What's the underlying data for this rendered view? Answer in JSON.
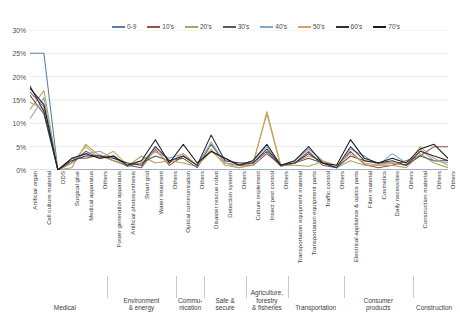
{
  "chart_data": {
    "type": "line",
    "title": "",
    "xlabel": "",
    "ylabel": "",
    "ylim": [
      0,
      30
    ],
    "ytick_labels": [
      "0%",
      "5%",
      "10%",
      "15%",
      "20%",
      "25%",
      "30%"
    ],
    "ytick_values": [
      0,
      5,
      10,
      15,
      20,
      25,
      30
    ],
    "grid": true,
    "legend_position": "top",
    "categories": [
      "Artificial organ",
      "Cell culture material",
      "DDS",
      "Surgical glue",
      "Medical apparatus",
      "Others",
      "Power generation apparatus",
      "Artificial photosynthesis",
      "Smart grid",
      "Water treatment",
      "Others",
      "Optical communication",
      "Others",
      "Disaster rescue robot",
      "Detection system",
      "Others",
      "Culture implement",
      "Insect pest control",
      "Others",
      "Transportation equipment material",
      "Transportation equipment parts",
      "Traffic control",
      "Others",
      "Electrical appliance & optics parts",
      "Fiber material",
      "Cosmetics",
      "Daily necessities",
      "Others",
      "Construction material",
      "Others",
      "Others"
    ],
    "groups": [
      {
        "label": "Medical",
        "start": 0,
        "end": 5
      },
      {
        "label": "Environment\n& energy",
        "start": 6,
        "end": 10
      },
      {
        "label": "Commu-\nnication",
        "start": 11,
        "end": 12
      },
      {
        "label": "Safe &\nsecure",
        "start": 13,
        "end": 15
      },
      {
        "label": "Agriculture,\nforestry\n& fisheries",
        "start": 16,
        "end": 18
      },
      {
        "label": "Transportation",
        "start": 19,
        "end": 22
      },
      {
        "label": "Consumer\nproducts",
        "start": 23,
        "end": 27
      },
      {
        "label": "Construction",
        "start": 28,
        "end": 30
      }
    ],
    "series": [
      {
        "name": "0-9",
        "color": "#5b7fa6",
        "values": [
          25,
          25,
          0,
          0,
          0,
          0,
          0,
          0,
          0,
          0,
          0,
          0,
          0,
          0,
          0,
          0,
          0,
          0,
          0,
          0,
          0,
          0,
          0,
          0,
          0,
          0,
          0,
          0,
          0,
          0,
          0
        ]
      },
      {
        "name": "10's",
        "color": "#9e4b4b",
        "values": [
          16.7,
          13.5,
          0,
          2.5,
          2.5,
          3.2,
          2.0,
          1.0,
          0.5,
          4.5,
          1.0,
          3.0,
          1.0,
          4.0,
          2.5,
          1.0,
          1.0,
          3.5,
          1.0,
          1.5,
          4.0,
          1.0,
          0.5,
          4.0,
          1.2,
          0.5,
          1.0,
          2.0,
          3.0,
          5.0,
          5.0
        ]
      },
      {
        "name": "20's",
        "color": "#b2a15c",
        "values": [
          13.0,
          17.0,
          0,
          0.5,
          5.5,
          3.0,
          2.0,
          0.8,
          3.0,
          1.5,
          2.0,
          1.5,
          0.8,
          4.5,
          1.0,
          0.5,
          1.0,
          12.5,
          1.0,
          1.0,
          0.8,
          1.8,
          0.5,
          2.0,
          1.0,
          1.0,
          1.0,
          0.5,
          3.5,
          1.5,
          0.5
        ]
      },
      {
        "name": "30's",
        "color": "#595959",
        "values": [
          16.0,
          12.0,
          0,
          1.5,
          4.0,
          2.5,
          3.0,
          0.8,
          1.5,
          3.0,
          2.0,
          2.5,
          0.5,
          5.5,
          1.5,
          1.0,
          1.5,
          4.0,
          0.8,
          1.5,
          2.5,
          1.5,
          0.5,
          3.0,
          2.0,
          1.5,
          1.5,
          1.0,
          3.0,
          2.0,
          2.0
        ]
      },
      {
        "name": "40's",
        "color": "#7fa9c9",
        "values": [
          11.0,
          15.5,
          0,
          2.0,
          3.5,
          4.0,
          2.5,
          1.0,
          2.0,
          4.0,
          2.5,
          3.5,
          1.0,
          6.0,
          1.5,
          1.0,
          2.0,
          5.0,
          1.0,
          2.0,
          4.5,
          2.0,
          0.5,
          4.5,
          3.0,
          1.0,
          3.5,
          1.5,
          4.5,
          2.0,
          1.5
        ]
      },
      {
        "name": "50's",
        "color": "#d2a261",
        "values": [
          14.5,
          13.0,
          0,
          1.5,
          5.0,
          2.5,
          4.0,
          1.0,
          1.5,
          4.0,
          1.5,
          3.5,
          1.0,
          4.0,
          1.5,
          0.5,
          1.5,
          12.0,
          0.8,
          1.5,
          3.0,
          2.0,
          1.0,
          3.5,
          1.5,
          1.0,
          1.5,
          1.0,
          5.0,
          2.5,
          1.0
        ]
      },
      {
        "name": "60's",
        "color": "#2d2f45",
        "values": [
          18.0,
          12.5,
          0,
          2.0,
          3.0,
          3.0,
          2.5,
          1.5,
          1.0,
          5.0,
          2.0,
          3.0,
          1.0,
          7.5,
          2.0,
          1.5,
          1.5,
          4.5,
          1.0,
          1.5,
          3.5,
          1.5,
          0.5,
          5.0,
          2.0,
          1.5,
          2.0,
          1.0,
          4.0,
          3.0,
          2.0
        ]
      },
      {
        "name": "70's",
        "color": "#1c1c1c",
        "values": [
          17.5,
          14.0,
          0,
          2.5,
          3.5,
          2.5,
          3.0,
          1.0,
          2.0,
          6.5,
          1.5,
          5.5,
          1.5,
          4.0,
          2.5,
          1.0,
          2.0,
          5.5,
          1.0,
          2.0,
          5.0,
          1.5,
          1.0,
          6.5,
          2.5,
          1.5,
          2.5,
          1.5,
          4.5,
          5.5,
          2.5
        ]
      }
    ]
  }
}
